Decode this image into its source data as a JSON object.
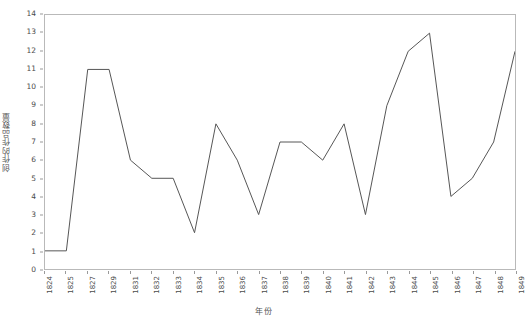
{
  "chart_data": {
    "type": "line",
    "title": "",
    "xlabel": "年份",
    "ylabel": "创作的作品数量",
    "categories": [
      "1824",
      "1825",
      "1827",
      "1829",
      "1831",
      "1832",
      "1833",
      "1834",
      "1835",
      "1836",
      "1837",
      "1838",
      "1839",
      "1840",
      "1841",
      "1842",
      "1843",
      "1844",
      "1845",
      "1846",
      "1847",
      "1848",
      "1849"
    ],
    "values": [
      1,
      1,
      11,
      11,
      6,
      5,
      5,
      2,
      8,
      6,
      3,
      7,
      7,
      6,
      8,
      3,
      9,
      12,
      13,
      4,
      5,
      7,
      12
    ],
    "series": [
      {
        "name": "创作的作品数量",
        "values": [
          1,
          1,
          11,
          11,
          6,
          5,
          5,
          2,
          8,
          6,
          3,
          7,
          7,
          6,
          8,
          3,
          9,
          12,
          13,
          4,
          5,
          7,
          12
        ]
      }
    ],
    "ylim": [
      0,
      14
    ],
    "y_ticks": [
      0,
      1,
      2,
      3,
      4,
      5,
      6,
      7,
      8,
      9,
      10,
      11,
      12,
      13,
      14
    ],
    "y_tick_labels": [
      "0",
      "1",
      "2",
      "3",
      "4",
      "5",
      "6",
      "7",
      "8",
      "9",
      "10",
      "11",
      "12",
      "13",
      "14"
    ],
    "grid": false,
    "legend": "none",
    "line_color": "#555555",
    "line_width": 1,
    "plot_border_color": "#b9b9b9",
    "background_color": "#ffffff",
    "axis_text_color": "#4a4a4a"
  }
}
